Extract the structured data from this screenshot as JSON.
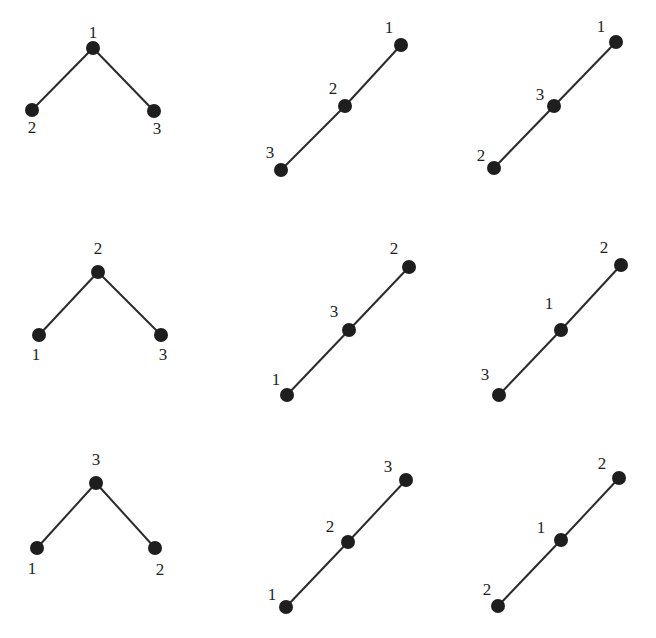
{
  "diagram": {
    "node_color": "#1e1e1e",
    "edge_color": "#2a2a2a",
    "graphs": [
      {
        "id": "r1c1",
        "shape": "V",
        "nodes": [
          {
            "label": "1",
            "x": 93,
            "y": 48,
            "lx": 93,
            "ly": 34
          },
          {
            "label": "2",
            "x": 32,
            "y": 110,
            "lx": 32,
            "ly": 129
          },
          {
            "label": "3",
            "x": 154,
            "y": 111,
            "lx": 157,
            "ly": 130
          }
        ],
        "edges": [
          [
            0,
            1
          ],
          [
            0,
            2
          ]
        ]
      },
      {
        "id": "r1c2",
        "shape": "line",
        "nodes": [
          {
            "label": "1",
            "x": 401,
            "y": 45,
            "lx": 389,
            "ly": 29
          },
          {
            "label": "2",
            "x": 345,
            "y": 106,
            "lx": 333,
            "ly": 90
          },
          {
            "label": "3",
            "x": 281,
            "y": 170,
            "lx": 270,
            "ly": 154
          }
        ],
        "edges": [
          [
            0,
            1
          ],
          [
            1,
            2
          ]
        ]
      },
      {
        "id": "r1c3",
        "shape": "line",
        "nodes": [
          {
            "label": "1",
            "x": 616,
            "y": 42,
            "lx": 601,
            "ly": 28
          },
          {
            "label": "3",
            "x": 554,
            "y": 106,
            "lx": 540,
            "ly": 96
          },
          {
            "label": "2",
            "x": 494,
            "y": 168,
            "lx": 481,
            "ly": 157
          }
        ],
        "edges": [
          [
            0,
            1
          ],
          [
            1,
            2
          ]
        ]
      },
      {
        "id": "r2c1",
        "shape": "V",
        "nodes": [
          {
            "label": "2",
            "x": 98,
            "y": 272,
            "lx": 98,
            "ly": 250
          },
          {
            "label": "1",
            "x": 39,
            "y": 335,
            "lx": 36,
            "ly": 356
          },
          {
            "label": "3",
            "x": 161,
            "y": 335,
            "lx": 163,
            "ly": 356
          }
        ],
        "edges": [
          [
            0,
            1
          ],
          [
            0,
            2
          ]
        ]
      },
      {
        "id": "r2c2",
        "shape": "line",
        "nodes": [
          {
            "label": "2",
            "x": 409,
            "y": 267,
            "lx": 394,
            "ly": 250
          },
          {
            "label": "3",
            "x": 349,
            "y": 330,
            "lx": 334,
            "ly": 313
          },
          {
            "label": "1",
            "x": 287,
            "y": 395,
            "lx": 276,
            "ly": 381
          }
        ],
        "edges": [
          [
            0,
            1
          ],
          [
            1,
            2
          ]
        ]
      },
      {
        "id": "r2c3",
        "shape": "line",
        "nodes": [
          {
            "label": "2",
            "x": 621,
            "y": 265,
            "lx": 604,
            "ly": 249
          },
          {
            "label": "1",
            "x": 561,
            "y": 330,
            "lx": 549,
            "ly": 305
          },
          {
            "label": "3",
            "x": 499,
            "y": 395,
            "lx": 485,
            "ly": 376
          }
        ],
        "edges": [
          [
            0,
            1
          ],
          [
            1,
            2
          ]
        ]
      },
      {
        "id": "r3c1",
        "shape": "V",
        "nodes": [
          {
            "label": "3",
            "x": 96,
            "y": 483,
            "lx": 96,
            "ly": 461
          },
          {
            "label": "1",
            "x": 37,
            "y": 548,
            "lx": 32,
            "ly": 570
          },
          {
            "label": "2",
            "x": 155,
            "y": 548,
            "lx": 160,
            "ly": 571
          }
        ],
        "edges": [
          [
            0,
            1
          ],
          [
            0,
            2
          ]
        ]
      },
      {
        "id": "r3c2",
        "shape": "line",
        "nodes": [
          {
            "label": "3",
            "x": 406,
            "y": 480,
            "lx": 388,
            "ly": 468
          },
          {
            "label": "2",
            "x": 348,
            "y": 542,
            "lx": 330,
            "ly": 528
          },
          {
            "label": "1",
            "x": 286,
            "y": 607,
            "lx": 272,
            "ly": 596
          }
        ],
        "edges": [
          [
            0,
            1
          ],
          [
            1,
            2
          ]
        ]
      },
      {
        "id": "r3c3",
        "shape": "line",
        "nodes": [
          {
            "label": "2",
            "x": 619,
            "y": 478,
            "lx": 602,
            "ly": 465
          },
          {
            "label": "1",
            "x": 561,
            "y": 540,
            "lx": 541,
            "ly": 529
          },
          {
            "label": "2",
            "x": 498,
            "y": 606,
            "lx": 487,
            "ly": 591
          }
        ],
        "edges": [
          [
            0,
            1
          ],
          [
            1,
            2
          ]
        ]
      }
    ]
  }
}
